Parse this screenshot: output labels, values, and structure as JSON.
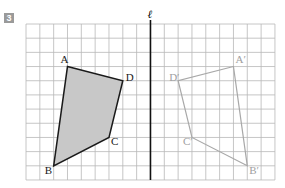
{
  "problem": {
    "number": "3"
  },
  "grid": {
    "cols": 18,
    "rows": 11,
    "x0": 26,
    "y0": 24,
    "cell_w": 13.83,
    "cell_h": 14.18,
    "line_color": "#b8b8b8"
  },
  "axis": {
    "label": "ℓ",
    "col": 9,
    "color": "#111111"
  },
  "original": {
    "fill": "#c8c8c8",
    "stroke": "#1a1a1a",
    "vertices": [
      {
        "name": "A",
        "x": 3,
        "y": 3
      },
      {
        "name": "D",
        "x": 7,
        "y": 4
      },
      {
        "name": "C",
        "x": 6,
        "y": 8
      },
      {
        "name": "B",
        "x": 2,
        "y": 10
      }
    ]
  },
  "reflection": {
    "stroke": "#a8a8a8",
    "vertices": [
      {
        "name": "A′",
        "x": 15,
        "y": 3
      },
      {
        "name": "D′",
        "x": 11,
        "y": 4
      },
      {
        "name": "C′",
        "x": 12,
        "y": 8
      },
      {
        "name": "B′",
        "x": 16,
        "y": 10
      }
    ]
  }
}
